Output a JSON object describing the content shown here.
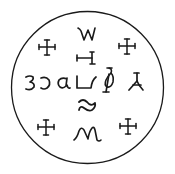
{
  "diagram": {
    "type": "seal",
    "border": {
      "shape": "circle",
      "cx": 87.5,
      "cy": 87.5,
      "r": 76,
      "color": "#1a1a1a"
    },
    "crosses": [
      {
        "position": "top-left",
        "x": 47,
        "y": 47
      },
      {
        "position": "top-right",
        "x": 127,
        "y": 46
      },
      {
        "position": "bottom-left",
        "x": 46,
        "y": 127
      },
      {
        "position": "bottom-right",
        "x": 128,
        "y": 126
      }
    ],
    "glyphs": [
      {
        "id": "w-glyph",
        "row": "top",
        "shape": "W"
      },
      {
        "id": "h-glyph",
        "row": "upper",
        "shape": "H-sideways"
      },
      {
        "id": "three-glyph",
        "row": "middle",
        "shape": "3"
      },
      {
        "id": "open-c-glyph",
        "row": "middle",
        "shape": "reversed-c"
      },
      {
        "id": "alpha-glyph",
        "row": "middle",
        "shape": "alpha"
      },
      {
        "id": "hook-glyph",
        "row": "middle",
        "shape": "u-hook"
      },
      {
        "id": "phi-glyph",
        "row": "middle",
        "shape": "phi-loop"
      },
      {
        "id": "inverted-y-glyph",
        "row": "middle",
        "shape": "inverted-y"
      },
      {
        "id": "tilde-glyph",
        "row": "lower",
        "shape": "tilde"
      },
      {
        "id": "m-glyph",
        "row": "bottom",
        "shape": "M"
      }
    ]
  }
}
